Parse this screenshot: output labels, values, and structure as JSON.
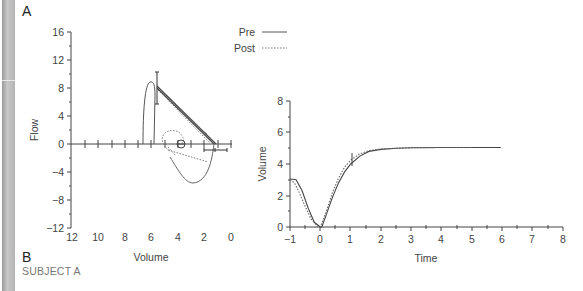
{
  "panels": {
    "a_label": "A",
    "b_label": "B",
    "subject": "SUBJECT A"
  },
  "legend": {
    "items": [
      {
        "label": "Pre",
        "style": "solid"
      },
      {
        "label": "Post",
        "style": "dotted"
      }
    ]
  },
  "chart_data": [
    {
      "type": "line",
      "title": "Flow-volume loop",
      "xlabel": "Volume",
      "ylabel": "Flow",
      "xlim": [
        12,
        0
      ],
      "ylim": [
        -12,
        16
      ],
      "x_reversed": true,
      "x_ticks": [
        "12",
        "10",
        "8",
        "6",
        "4",
        "2",
        "0"
      ],
      "y_ticks": [
        "16",
        "12",
        "8",
        "4",
        "0",
        "−4",
        "−8",
        "−12"
      ],
      "grid": false,
      "legend_position": "top-right",
      "series": [
        {
          "name": "Pre",
          "style": "solid",
          "points": [
            [
              5.9,
              0
            ],
            [
              5.8,
              8.5
            ],
            [
              5.6,
              8.7
            ],
            [
              5.4,
              7.5
            ],
            [
              5.2,
              0
            ],
            [
              5.0,
              8.0
            ],
            [
              4.0,
              5.7
            ],
            [
              3.0,
              3.4
            ],
            [
              2.0,
              1.1
            ],
            [
              1.5,
              0
            ],
            [
              1.7,
              -2.5
            ],
            [
              2.3,
              -5.3
            ],
            [
              2.8,
              -5.6
            ],
            [
              3.8,
              -4.0
            ],
            [
              4.4,
              -2.4
            ]
          ]
        },
        {
          "name": "Post",
          "style": "dotted",
          "points": [
            [
              5.0,
              8.1
            ],
            [
              4.0,
              5.5
            ],
            [
              3.0,
              3.2
            ],
            [
              1.7,
              0
            ],
            [
              2.2,
              -2.3
            ],
            [
              4.3,
              -1.4
            ],
            [
              4.7,
              0
            ],
            [
              4.5,
              1.4
            ],
            [
              3.8,
              1.2
            ],
            [
              3.3,
              0.2
            ]
          ]
        }
      ],
      "annotations": [
        {
          "type": "error-bar-vertical",
          "x": 5.0,
          "y_range": [
            4.4,
            10.0
          ]
        },
        {
          "type": "error-bar-horizontal",
          "y": -1.0,
          "x_range": [
            2.6,
            0.8
          ]
        },
        {
          "type": "circle-marker",
          "x": 3.8,
          "y": 0
        }
      ]
    },
    {
      "type": "line",
      "title": "Volume-time curve",
      "xlabel": "Time",
      "ylabel": "Volume",
      "xlim": [
        -1,
        8
      ],
      "ylim": [
        0,
        8
      ],
      "x_ticks": [
        "−1",
        "0",
        "1",
        "2",
        "3",
        "4",
        "5",
        "6",
        "7",
        "8"
      ],
      "y_ticks": [
        "8",
        "6",
        "4",
        "2",
        "0"
      ],
      "grid": false,
      "series": [
        {
          "name": "Pre",
          "style": "solid",
          "x": [
            -1.0,
            -0.8,
            -0.6,
            -0.4,
            -0.2,
            0.0,
            0.05,
            0.2,
            0.4,
            0.6,
            0.8,
            1.0,
            1.3,
            1.6,
            2.0,
            2.5,
            3.0,
            4.0,
            5.0,
            5.95
          ],
          "y": [
            3.05,
            3.0,
            2.3,
            1.2,
            0.3,
            0.0,
            0.0,
            0.8,
            1.9,
            2.8,
            3.5,
            4.0,
            4.5,
            4.8,
            4.93,
            5.0,
            5.03,
            5.05,
            5.05,
            5.05
          ]
        },
        {
          "name": "Post",
          "style": "dotted",
          "x": [
            -1.0,
            -0.85,
            -0.7,
            -0.5,
            -0.3,
            -0.1,
            0.0,
            0.2,
            0.4,
            0.6,
            0.8,
            1.0,
            1.3,
            1.6,
            2.0,
            2.5,
            3.0,
            4.0,
            5.0
          ],
          "y": [
            3.0,
            2.8,
            2.2,
            1.3,
            0.5,
            0.05,
            0.0,
            1.0,
            2.2,
            3.1,
            3.8,
            4.25,
            4.65,
            4.85,
            4.95,
            5.0,
            5.03,
            5.05,
            5.05
          ]
        }
      ],
      "annotations": [
        {
          "type": "error-bar-vertical",
          "x": 1.05,
          "y_range": [
            4.0,
            4.8
          ]
        }
      ]
    }
  ]
}
